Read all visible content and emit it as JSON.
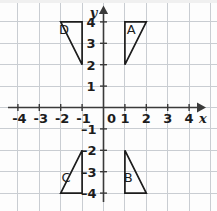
{
  "figure": {
    "axes": {
      "x_name": "x",
      "y_name": "y",
      "origin_label": "0",
      "x_ticks": [
        "-4",
        "-3",
        "-2",
        "-1",
        "1",
        "2",
        "3",
        "4"
      ],
      "y_ticks_positive": [
        "1",
        "2",
        "3",
        "4"
      ],
      "y_ticks_negative": [
        "-1",
        "-2",
        "-3",
        "-4"
      ],
      "x_range": [
        -5,
        5
      ],
      "y_range": [
        -5,
        5
      ],
      "grid": true,
      "grid_color": "#c9cdd2",
      "axis_color": "#3a3a3a",
      "shape_color": "#1c1c1c"
    },
    "triangles": [
      {
        "label": "A",
        "vertices": [
          [
            1,
            4
          ],
          [
            2,
            4
          ],
          [
            1,
            2
          ]
        ],
        "right_angle_at": [
          1,
          4
        ],
        "label_pos": [
          1.3,
          3.45
        ],
        "quadrant": "I"
      },
      {
        "label": "B",
        "vertices": [
          [
            1,
            -2
          ],
          [
            1,
            -4
          ],
          [
            2,
            -4
          ]
        ],
        "right_angle_at": [
          1,
          -4
        ],
        "label_pos": [
          1.15,
          -3.5
        ],
        "quadrant": "IV"
      },
      {
        "label": "C",
        "vertices": [
          [
            -1,
            -2
          ],
          [
            -1,
            -4
          ],
          [
            -2,
            -4
          ]
        ],
        "right_angle_at": [
          -1,
          -4
        ],
        "label_pos": [
          -1.75,
          -3.5
        ],
        "quadrant": "III"
      },
      {
        "label": "D",
        "vertices": [
          [
            -2,
            4
          ],
          [
            -1,
            4
          ],
          [
            -1,
            2
          ]
        ],
        "right_angle_at": [
          -2,
          4
        ],
        "label_pos": [
          -1.85,
          3.45
        ],
        "quadrant": "II"
      }
    ]
  }
}
